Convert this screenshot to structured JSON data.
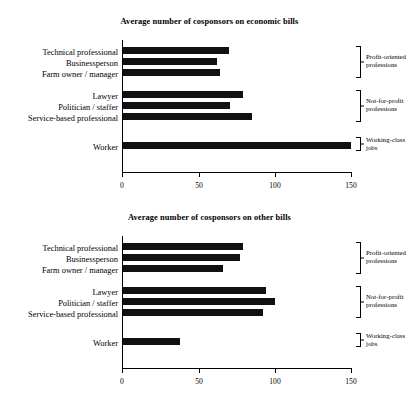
{
  "chart_data": [
    {
      "type": "bar",
      "orientation": "horizontal",
      "title": "Average number of cosponsors on economic bills",
      "xlabel": "",
      "ylabel": "",
      "xlim": [
        0,
        150
      ],
      "xticks": [
        0,
        50,
        100,
        150
      ],
      "xtick_labels": [
        "0",
        "50",
        "100",
        "150"
      ],
      "grid": false,
      "legend": "none",
      "bar_color": "#111111",
      "categories": [
        "Technical professional",
        "Businessperson",
        "Farm owner / manager",
        "Lawyer",
        "Politician / staffer",
        "Service-based professional",
        "Worker"
      ],
      "values": [
        69,
        61,
        63,
        78,
        70,
        84,
        149
      ],
      "groups": [
        {
          "label": "Profit-oriented professions",
          "members": [
            "Technical professional",
            "Businessperson",
            "Farm owner / manager"
          ]
        },
        {
          "label": "Not-for-profit professions",
          "members": [
            "Lawyer",
            "Politician / staffer",
            "Service-based professional"
          ]
        },
        {
          "label": "Working-class jobs",
          "members": [
            "Worker"
          ]
        }
      ]
    },
    {
      "type": "bar",
      "orientation": "horizontal",
      "title": "Average number of cosponsors on other bills",
      "xlabel": "",
      "ylabel": "",
      "xlim": [
        0,
        150
      ],
      "xticks": [
        0,
        50,
        100,
        150
      ],
      "xtick_labels": [
        "0",
        "50",
        "100",
        "150"
      ],
      "grid": false,
      "legend": "none",
      "bar_color": "#111111",
      "categories": [
        "Technical professional",
        "Businessperson",
        "Farm owner / manager",
        "Lawyer",
        "Politician / staffer",
        "Service-based professional",
        "Worker"
      ],
      "values": [
        78,
        76,
        65,
        93,
        99,
        91,
        37
      ],
      "groups": [
        {
          "label": "Profit-oriented professions",
          "members": [
            "Technical professional",
            "Businessperson",
            "Farm owner / manager"
          ]
        },
        {
          "label": "Not-for-profit professions",
          "members": [
            "Lawyer",
            "Politician / staffer",
            "Service-based professional"
          ]
        },
        {
          "label": "Working-class jobs",
          "members": [
            "Worker"
          ]
        }
      ]
    }
  ]
}
